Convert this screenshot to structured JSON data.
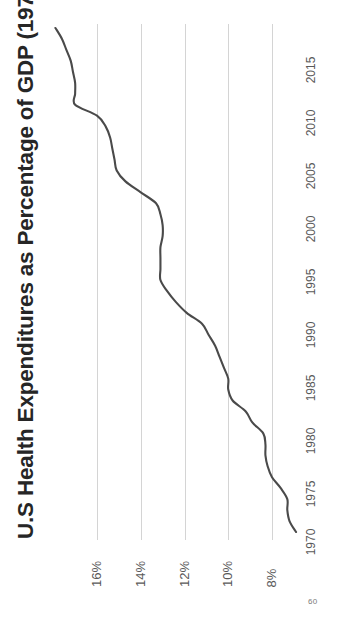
{
  "slide": {
    "page_number": "60",
    "background_color": "#ffffff"
  },
  "chart_title": "U.S Health Expenditures as Percentage of GDP (1970-2016)",
  "style": {
    "line_color": "#4a4a4a",
    "gridline_color": "#d4d4d4",
    "tick_label_color": "#595959",
    "title_color": "#262626"
  },
  "axes": {
    "value_axis_ticks": [
      "16%",
      "14%",
      "12%",
      "10%",
      "8%"
    ],
    "category_axis_ticks": [
      "2015",
      "2010",
      "2005",
      "2000",
      "1995",
      "1990",
      "1985",
      "1980",
      "1975",
      "1970"
    ]
  },
  "chart_data": {
    "type": "line",
    "title": "U.S Health Expenditures as Percentage of GDP (1970-2016)",
    "xlabel": "",
    "ylabel": "",
    "orientation": "rotated-90-ccw",
    "grid": true,
    "legend": "none",
    "xlim": [
      1970,
      2016
    ],
    "ylim": [
      6.9,
      18.0
    ],
    "yticks": [
      8,
      10,
      12,
      14,
      16
    ],
    "ytick_labels": [
      "8%",
      "10%",
      "12%",
      "14%",
      "16%"
    ],
    "xticks": [
      1970,
      1975,
      1980,
      1985,
      1990,
      1995,
      2000,
      2005,
      2010,
      2015
    ],
    "series": [
      {
        "name": "U.S Health Expenditures (% of GDP)",
        "x": [
          1970,
          1971,
          1972,
          1973,
          1974,
          1975,
          1976,
          1977,
          1978,
          1979,
          1980,
          1981,
          1982,
          1983,
          1984,
          1985,
          1986,
          1987,
          1988,
          1989,
          1990,
          1991,
          1992,
          1993,
          1994,
          1995,
          1996,
          1997,
          1998,
          1999,
          2000,
          2001,
          2002,
          2003,
          2004,
          2005,
          2006,
          2007,
          2008,
          2009,
          2010,
          2011,
          2012,
          2013,
          2014,
          2015,
          2016
        ],
        "values": [
          6.9,
          7.2,
          7.3,
          7.3,
          7.6,
          8.0,
          8.2,
          8.3,
          8.3,
          8.4,
          8.9,
          9.2,
          9.8,
          10.0,
          10.0,
          10.2,
          10.4,
          10.6,
          10.9,
          11.2,
          11.9,
          12.4,
          12.8,
          13.1,
          13.1,
          13.1,
          13.1,
          13.0,
          13.0,
          13.1,
          13.3,
          14.0,
          14.7,
          15.1,
          15.2,
          15.3,
          15.4,
          15.6,
          16.0,
          17.0,
          17.0,
          17.0,
          17.1,
          17.2,
          17.4,
          17.6,
          17.9
        ]
      }
    ]
  }
}
